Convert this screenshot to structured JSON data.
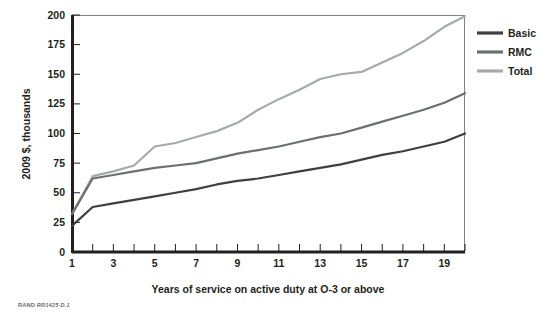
{
  "figure": {
    "credit_prefix": "RAND",
    "credit_id": "RR1425-D.1"
  },
  "chart_data": {
    "type": "line",
    "title": "",
    "xlabel": "Years of service on active duty at O-3 or above",
    "ylabel": "2009 $, thousands",
    "xlim": [
      1,
      20
    ],
    "ylim": [
      0,
      200
    ],
    "grid": false,
    "legend_position": "right",
    "x_ticks_major": [
      1,
      3,
      5,
      7,
      9,
      11,
      13,
      15,
      17,
      19
    ],
    "x_ticks_minor": [
      2,
      4,
      6,
      8,
      10,
      12,
      14,
      16,
      18,
      20
    ],
    "x_tick_labels": [
      "1",
      "3",
      "5",
      "7",
      "9",
      "11",
      "13",
      "15",
      "17",
      "19"
    ],
    "y_ticks": [
      0,
      25,
      50,
      75,
      100,
      125,
      150,
      175,
      200
    ],
    "y_tick_labels": [
      "0",
      "25",
      "50",
      "75",
      "100",
      "125",
      "150",
      "175",
      "200"
    ],
    "x": [
      1,
      2,
      3,
      4,
      5,
      6,
      7,
      8,
      9,
      10,
      11,
      12,
      13,
      14,
      15,
      16,
      17,
      18,
      19,
      20
    ],
    "series": [
      {
        "name": "Basic",
        "color": "#3f3f3f",
        "values": [
          22,
          38,
          41,
          44,
          47,
          50,
          53,
          57,
          60,
          62,
          65,
          68,
          71,
          74,
          78,
          82,
          85,
          89,
          93,
          100
        ]
      },
      {
        "name": "RMC",
        "color": "#6d6e71",
        "values": [
          32,
          62,
          65,
          68,
          71,
          73,
          75,
          79,
          83,
          86,
          89,
          93,
          97,
          100,
          105,
          110,
          115,
          120,
          126,
          134
        ]
      },
      {
        "name": "Total",
        "color": "#a7a9ac",
        "values": [
          32,
          64,
          68,
          73,
          89,
          92,
          97,
          102,
          109,
          120,
          129,
          137,
          146,
          150,
          152,
          160,
          168,
          178,
          190,
          199
        ]
      }
    ]
  },
  "legend": {
    "items": [
      {
        "label": "Basic",
        "color": "#3f3f3f"
      },
      {
        "label": "RMC",
        "color": "#6d6e71"
      },
      {
        "label": "Total",
        "color": "#a7a9ac"
      }
    ]
  }
}
